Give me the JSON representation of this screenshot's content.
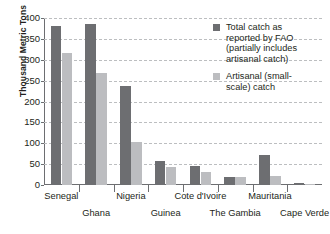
{
  "chart_data": {
    "type": "bar",
    "title": "",
    "xlabel": "",
    "ylabel": "Thousand Metric Tons",
    "ylim": [
      0,
      400
    ],
    "ytick_values": [
      0,
      50,
      100,
      150,
      200,
      250,
      300,
      350,
      400
    ],
    "ytick_labels": [
      "0",
      "50",
      "100",
      "150",
      "200",
      "250",
      "300",
      "350",
      "400"
    ],
    "grid": true,
    "legend_position": "upper-right-inside",
    "categories": [
      "Senegal",
      "Ghana",
      "Nigeria",
      "Guinea",
      "Cote d'Ivoire",
      "The Gambia",
      "Mauritania",
      "Cape Verde"
    ],
    "series": [
      {
        "name": "Total catch as reported by FAO (partially includes artisanal catch)",
        "color": "#6d6e71",
        "values": [
          380,
          385,
          238,
          57,
          45,
          20,
          72,
          5
        ]
      },
      {
        "name": "Artisanal (small-scale) catch",
        "color": "#bcbdc0",
        "values": [
          317,
          268,
          103,
          43,
          30,
          20,
          22,
          3
        ]
      }
    ]
  },
  "legend": {
    "items": [
      {
        "swatch": "dark",
        "lines": [
          "Total catch as",
          "reported by FAO",
          "(partially includes",
          "artisanal catch)"
        ]
      },
      {
        "swatch": "light",
        "lines": [
          "Artisanal (small-",
          "scale) catch"
        ]
      }
    ]
  },
  "footer": {
    "smudge_text": ""
  }
}
